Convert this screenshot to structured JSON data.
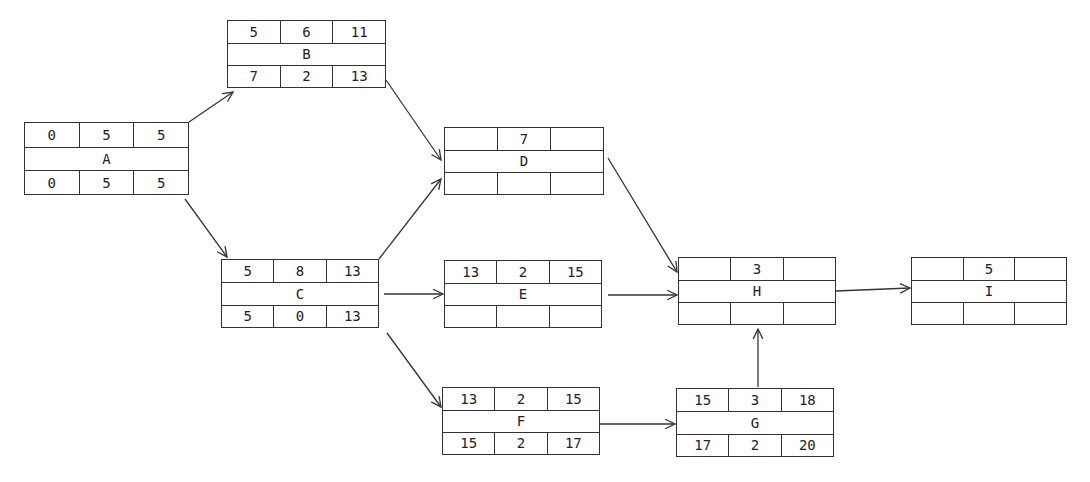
{
  "diagram": {
    "type": "activity-on-node network",
    "nodes": [
      {
        "id": "A",
        "x": 24,
        "y": 122,
        "w": 165,
        "h": 73,
        "top": [
          "0",
          "5",
          "5"
        ],
        "name": "A",
        "bottom": [
          "0",
          "5",
          "5"
        ]
      },
      {
        "id": "B",
        "x": 227,
        "y": 20,
        "w": 159,
        "h": 68,
        "top": [
          "5",
          "6",
          "11"
        ],
        "name": "B",
        "bottom": [
          "7",
          "2",
          "13"
        ]
      },
      {
        "id": "C",
        "x": 221,
        "y": 259,
        "w": 158,
        "h": 69,
        "top": [
          "5",
          "8",
          "13"
        ],
        "name": "C",
        "bottom": [
          "5",
          "0",
          "13"
        ]
      },
      {
        "id": "D",
        "x": 444,
        "y": 127,
        "w": 160,
        "h": 68,
        "top": [
          "",
          "7",
          ""
        ],
        "name": "D",
        "bottom": [
          "",
          "",
          ""
        ]
      },
      {
        "id": "E",
        "x": 444,
        "y": 260,
        "w": 158,
        "h": 68,
        "top": [
          "13",
          "2",
          "15"
        ],
        "name": "E",
        "bottom": [
          "",
          "",
          ""
        ]
      },
      {
        "id": "F",
        "x": 442,
        "y": 387,
        "w": 158,
        "h": 68,
        "top": [
          "13",
          "2",
          "15"
        ],
        "name": "F",
        "bottom": [
          "15",
          "2",
          "17"
        ]
      },
      {
        "id": "G",
        "x": 676,
        "y": 388,
        "w": 158,
        "h": 69,
        "top": [
          "15",
          "3",
          "18"
        ],
        "name": "G",
        "bottom": [
          "17",
          "2",
          "20"
        ]
      },
      {
        "id": "H",
        "x": 678,
        "y": 257,
        "w": 158,
        "h": 68,
        "top": [
          "",
          "3",
          ""
        ],
        "name": "H",
        "bottom": [
          "",
          "",
          ""
        ]
      },
      {
        "id": "I",
        "x": 911,
        "y": 257,
        "w": 156,
        "h": 68,
        "top": [
          "",
          "5",
          ""
        ],
        "name": "I",
        "bottom": [
          "",
          "",
          ""
        ]
      }
    ],
    "edges": [
      {
        "from": "A",
        "to": "B",
        "x1": 189,
        "y1": 122,
        "x2": 233,
        "y2": 92
      },
      {
        "from": "A",
        "to": "C",
        "x1": 185,
        "y1": 199,
        "x2": 227,
        "y2": 257
      },
      {
        "from": "B",
        "to": "D",
        "x1": 386,
        "y1": 80,
        "x2": 441,
        "y2": 160
      },
      {
        "from": "C",
        "to": "D",
        "x1": 379,
        "y1": 259,
        "x2": 441,
        "y2": 179
      },
      {
        "from": "C",
        "to": "E",
        "x1": 384,
        "y1": 294,
        "x2": 443,
        "y2": 294
      },
      {
        "from": "C",
        "to": "F",
        "x1": 387,
        "y1": 333,
        "x2": 441,
        "y2": 407
      },
      {
        "from": "D",
        "to": "H",
        "x1": 608,
        "y1": 158,
        "x2": 677,
        "y2": 272
      },
      {
        "from": "E",
        "to": "H",
        "x1": 608,
        "y1": 295,
        "x2": 677,
        "y2": 295
      },
      {
        "from": "F",
        "to": "G",
        "x1": 600,
        "y1": 424,
        "x2": 675,
        "y2": 424
      },
      {
        "from": "G",
        "to": "H",
        "x1": 758,
        "y1": 387,
        "x2": 758,
        "y2": 329
      },
      {
        "from": "H",
        "to": "I",
        "x1": 836,
        "y1": 291,
        "x2": 910,
        "y2": 288
      }
    ],
    "line_color": "#333333"
  }
}
